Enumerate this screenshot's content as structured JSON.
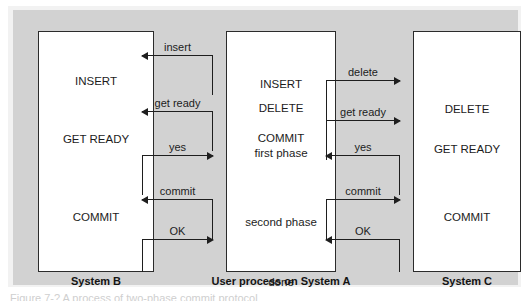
{
  "figure": {
    "background_color": "#d2d2d2",
    "frame_color": "#f2f2f2",
    "box_fill": "#ffffff",
    "line_color": "#1e1e1e",
    "caption_partial": "Figure 7-?  A process of two-phase commit protocol"
  },
  "boxes": {
    "left": {
      "label": "System B",
      "lines": [
        {
          "text": "INSERT",
          "top": 43
        },
        {
          "text": "GET READY",
          "top": 101
        },
        {
          "text": "COMMIT",
          "top": 179
        }
      ]
    },
    "middle": {
      "label": "User process on System A",
      "lines": [
        {
          "text": "INSERT",
          "top": 46
        },
        {
          "text": "DELETE",
          "top": 70
        },
        {
          "text": "COMMIT",
          "top": 100
        },
        {
          "text": "first phase",
          "top": 115
        },
        {
          "text": "second phase",
          "top": 184
        },
        {
          "text": "done",
          "top": 244
        }
      ]
    },
    "right": {
      "label": "System C",
      "lines": [
        {
          "text": "DELETE",
          "top": 71
        },
        {
          "text": "GET READY",
          "top": 111
        },
        {
          "text": "COMMIT",
          "top": 179
        }
      ]
    }
  },
  "messages": {
    "left_channel": [
      {
        "label": "insert",
        "direction": "to-left",
        "top": 45,
        "stub_from": 45,
        "stub_to": 85
      },
      {
        "label": "get ready",
        "direction": "to-left",
        "top": 101,
        "stub_from": 101,
        "stub_to": 141
      },
      {
        "label": "yes",
        "direction": "to-right",
        "top": 145,
        "stub_from": 145,
        "stub_to": 185
      },
      {
        "label": "commit",
        "direction": "to-left",
        "top": 189,
        "stub_from": 189,
        "stub_to": 229
      },
      {
        "label": "OK",
        "direction": "to-right",
        "top": 229,
        "stub_from": 229,
        "stub_to": 262
      }
    ],
    "right_channel": [
      {
        "label": "delete",
        "direction": "to-right",
        "top": 70,
        "stub_from": 70,
        "stub_to": 110
      },
      {
        "label": "get ready",
        "direction": "to-right",
        "top": 110,
        "stub_from": 110,
        "stub_to": 150
      },
      {
        "label": "yes",
        "direction": "to-left",
        "top": 145,
        "stub_from": 145,
        "stub_to": 185
      },
      {
        "label": "commit",
        "direction": "to-right",
        "top": 189,
        "stub_from": 189,
        "stub_to": 229
      },
      {
        "label": "OK",
        "direction": "to-left",
        "top": 229,
        "stub_from": 229,
        "stub_to": 262
      }
    ]
  }
}
